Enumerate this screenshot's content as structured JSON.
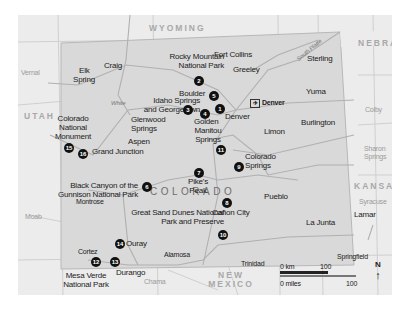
{
  "map": {
    "states": {
      "wyoming": "WYOMING",
      "nebraska": "NEBRASKA",
      "utah": "UTAH",
      "kansas": "KANSAS",
      "colorado": "COLORADO",
      "new_mexico_line1": "NEW",
      "new_mexico_line2": "MEXICO"
    },
    "river": "South Platte",
    "river_white": "White",
    "outside_towns": {
      "vernal": "Vernal",
      "moab": "Moab",
      "colby": "Colby",
      "sharon_springs_1": "Sharon",
      "sharon_springs_2": "Springs",
      "syracuse": "Syracuse",
      "chama": "Chama"
    },
    "towns": {
      "craig": "Craig",
      "elk_spring_1": "Elk",
      "elk_spring_2": "Spring",
      "fort_collins": "Fort Collins",
      "greeley": "Greeley",
      "sterling": "Sterling",
      "yuma": "Yuma",
      "boulder": "Boulder",
      "denver": "Denver",
      "denver_airport": "Denver",
      "golden": "Golden",
      "limon": "Limon",
      "burlington": "Burlington",
      "glenwood_1": "Glenwood",
      "glenwood_2": "Springs",
      "aspen": "Aspen",
      "grand_junction": "Grand Junction",
      "montrose": "Montrose",
      "pueblo": "Pueblo",
      "canon_city": "Cañon City",
      "la_junta": "La Junta",
      "lamar": "Lamar",
      "ouray": "Ouray",
      "alamosa": "Alamosa",
      "trinidad": "Trinidad",
      "springfield": "Springfield",
      "cortez": "Cortez",
      "durango": "Durango"
    },
    "sights": [
      {
        "num": "1",
        "label": "Denver"
      },
      {
        "num": "2",
        "label": "Rocky Mountain National Park"
      },
      {
        "num": "3",
        "label": "Idaho Springs and Georgetown"
      },
      {
        "num": "4",
        "label": "Golden"
      },
      {
        "num": "5",
        "label": "Boulder"
      },
      {
        "num": "6",
        "label": "Black Canyon of the Gunnison National Park"
      },
      {
        "num": "7",
        "label": "Pike's Peak"
      },
      {
        "num": "8",
        "label": "Cañon City"
      },
      {
        "num": "9",
        "label": "Colorado Springs"
      },
      {
        "num": "10",
        "label": "Great Sand Dunes National Park and Preserve"
      },
      {
        "num": "11",
        "label": "Manitou Springs"
      },
      {
        "num": "12",
        "label": "Mesa Verde National Park"
      },
      {
        "num": "13",
        "label": "Durango"
      },
      {
        "num": "14",
        "label": "Ouray"
      },
      {
        "num": "15",
        "label": "Colorado National Monument"
      },
      {
        "num": "16",
        "label": "Grand Junction"
      }
    ],
    "labels": {
      "rmnp_1": "Rocky Mountain",
      "rmnp_2": "National Park",
      "idaho_1": "Idaho Springs",
      "idaho_2": "and Georgetown",
      "cnm_1": "Colorado",
      "cnm_2": "National",
      "cnm_3": "Monument",
      "bc_1": "Black Canyon of the",
      "bc_2": "Gunnison National Park",
      "manitou_1": "Manitou",
      "manitou_2": "Springs",
      "pikes_1": "Pike's",
      "pikes_2": "Peak",
      "cs_1": "Colorado",
      "cs_2": "Springs",
      "gsd_1": "Great Sand Dunes National",
      "gsd_2": "Park and Preserve",
      "mv_1": "Mesa Verde",
      "mv_2": "National Park"
    },
    "highways": [
      "191",
      "13",
      "40",
      "13",
      "70",
      "25",
      "76",
      "36",
      "70",
      "25",
      "50",
      "287",
      "160",
      "50",
      "385",
      "83",
      "160",
      "25"
    ],
    "scale": {
      "km_start": "0 km",
      "km_end": "100",
      "mi_start": "0 miles",
      "mi_end": "100"
    },
    "north": "N",
    "colors": {
      "background": "#ececec",
      "colorado_fill": "#d9d9d9",
      "marker": "#111111"
    }
  }
}
